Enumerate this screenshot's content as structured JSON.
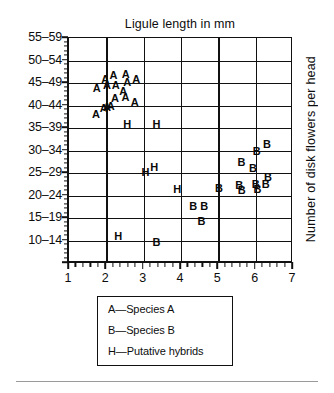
{
  "chart_data": {
    "type": "scatter",
    "title": "Ligule length in mm",
    "xlabel": "Ligule length in mm",
    "ylabel": "Number of disk flowers per head",
    "xlim": [
      1,
      7
    ],
    "ylim": [
      10,
      59
    ],
    "grid": true,
    "x_ticks": [
      1,
      2,
      3,
      4,
      5,
      6,
      7
    ],
    "x_tick_labels": [
      "1",
      "2",
      "3",
      "4",
      "5",
      "6",
      "7"
    ],
    "x_minor_per_interval": 5,
    "y_tick_labels": [
      "55–59",
      "50–54",
      "45–49",
      "40–44",
      "35–39",
      "30–34",
      "25–29",
      "20–24",
      "15–19",
      "10–14"
    ],
    "y_bin_starts": [
      55,
      50,
      45,
      40,
      35,
      30,
      25,
      20,
      15,
      10
    ],
    "y_minor_per_interval": 5,
    "marker_type": "text-glyph",
    "legend_position": "below-axes",
    "series": [
      {
        "name": "Species A",
        "glyph": "A",
        "legend_label": "A—Species A",
        "points": [
          {
            "x": 1.74,
            "y": 49.0
          },
          {
            "x": 1.97,
            "y": 51.0
          },
          {
            "x": 2.02,
            "y": 49.6
          },
          {
            "x": 2.19,
            "y": 51.8
          },
          {
            "x": 2.25,
            "y": 49.6
          },
          {
            "x": 2.52,
            "y": 51.9
          },
          {
            "x": 2.56,
            "y": 50.2
          },
          {
            "x": 2.45,
            "y": 48.3
          },
          {
            "x": 2.8,
            "y": 51.0
          },
          {
            "x": 1.72,
            "y": 43.2
          },
          {
            "x": 1.93,
            "y": 44.4
          },
          {
            "x": 2.02,
            "y": 44.6
          },
          {
            "x": 2.12,
            "y": 44.9
          },
          {
            "x": 2.23,
            "y": 46.6
          },
          {
            "x": 2.51,
            "y": 46.9
          },
          {
            "x": 2.76,
            "y": 45.8
          }
        ]
      },
      {
        "name": "Species B",
        "glyph": "B",
        "legend_label": "B—Species B",
        "points": [
          {
            "x": 6.3,
            "y": 36.4
          },
          {
            "x": 6.03,
            "y": 35.0
          },
          {
            "x": 5.62,
            "y": 32.4
          },
          {
            "x": 5.93,
            "y": 31.2
          },
          {
            "x": 6.33,
            "y": 29.2
          },
          {
            "x": 5.02,
            "y": 26.7
          },
          {
            "x": 5.56,
            "y": 27.4
          },
          {
            "x": 5.63,
            "y": 26.3
          },
          {
            "x": 6.0,
            "y": 27.6
          },
          {
            "x": 6.05,
            "y": 26.4
          },
          {
            "x": 6.27,
            "y": 27.5
          },
          {
            "x": 4.33,
            "y": 22.6
          },
          {
            "x": 4.62,
            "y": 22.6
          },
          {
            "x": 4.55,
            "y": 19.4
          },
          {
            "x": 3.34,
            "y": 14.6
          }
        ]
      },
      {
        "name": "Putative hybrids",
        "glyph": "H",
        "legend_label": "H—Putative hybrids",
        "points": [
          {
            "x": 2.56,
            "y": 40.9
          },
          {
            "x": 3.34,
            "y": 40.9
          },
          {
            "x": 3.05,
            "y": 30.2
          },
          {
            "x": 3.28,
            "y": 31.4
          },
          {
            "x": 3.9,
            "y": 26.5
          },
          {
            "x": 2.32,
            "y": 16.0
          }
        ]
      }
    ]
  }
}
